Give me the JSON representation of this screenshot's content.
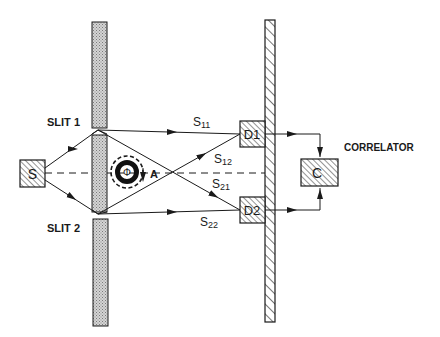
{
  "diagram": {
    "type": "two-slit intensity correlation experiment (Aharonov-Bohm flux)",
    "labels": {
      "slit1": "SLIT 1",
      "slit2": "SLIT 2",
      "source": "S",
      "flux": "Φ",
      "vector_potential": "A",
      "detector1": "D1",
      "detector2": "D2",
      "correlator_box": "C",
      "correlator": "CORRELATOR"
    },
    "paths": [
      {
        "id": "S11",
        "base": "S",
        "sub": "11"
      },
      {
        "id": "S12",
        "base": "S",
        "sub": "12"
      },
      {
        "id": "S21",
        "base": "S",
        "sub": "21"
      },
      {
        "id": "S22",
        "base": "S",
        "sub": "22"
      }
    ],
    "colors": {
      "ink": "#1a1a1a",
      "screen_fill": "#c8c8c8",
      "background": "#ffffff"
    }
  }
}
